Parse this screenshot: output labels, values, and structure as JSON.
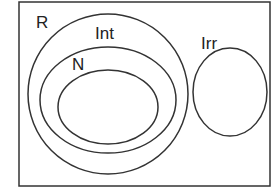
{
  "diagram": {
    "type": "venn-euler",
    "sets": [
      {
        "id": "R",
        "label": "R",
        "contains": [
          "Int",
          "Irr"
        ]
      },
      {
        "id": "Int",
        "label": "Int",
        "contains": [
          "N"
        ]
      },
      {
        "id": "N",
        "label": "N",
        "contains": [
          "inner"
        ]
      },
      {
        "id": "inner",
        "label": ""
      },
      {
        "id": "Irr",
        "label": "Irr"
      }
    ],
    "labels": {
      "r": "R",
      "int": "Int",
      "n": "N",
      "irr": "Irr"
    }
  }
}
